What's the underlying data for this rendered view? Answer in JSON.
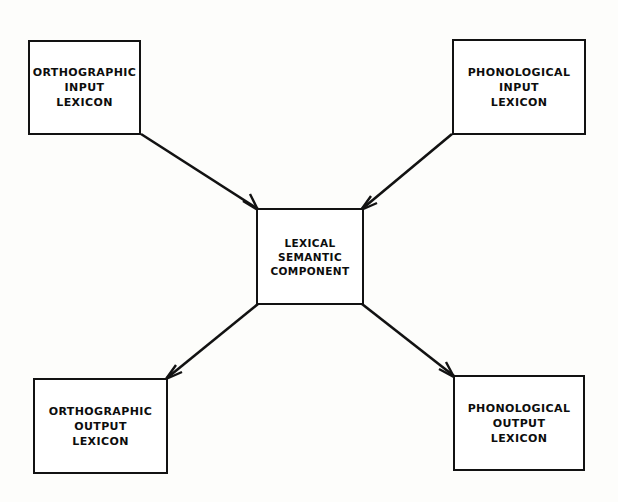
{
  "diagram": {
    "background_color": "#fdfdfb",
    "stroke_color": "#121212",
    "nodes": [
      {
        "id": "ortho-input",
        "lines": [
          "ORTHOGRAPHIC",
          "INPUT",
          "LEXICON"
        ],
        "position": "top-left"
      },
      {
        "id": "phono-input",
        "lines": [
          "PHONOLOGICAL",
          "INPUT",
          "LEXICON"
        ],
        "position": "top-right"
      },
      {
        "id": "lexical-semantic",
        "lines": [
          "LEXICAL",
          "SEMANTIC",
          "COMPONENT"
        ],
        "position": "center"
      },
      {
        "id": "ortho-output",
        "lines": [
          "ORTHOGRAPHIC",
          "OUTPUT",
          "LEXICON"
        ],
        "position": "bottom-left"
      },
      {
        "id": "phono-output",
        "lines": [
          "PHONOLOGICAL",
          "OUTPUT",
          "LEXICON"
        ],
        "position": "bottom-right"
      }
    ],
    "edges": [
      {
        "id": "edge-ortho-input-to-center",
        "from": "ortho-input",
        "to": "lexical-semantic",
        "arrow": "to",
        "x1": 141,
        "y1": 134,
        "x2": 258,
        "y2": 209
      },
      {
        "id": "edge-phono-input-to-center",
        "from": "phono-input",
        "to": "lexical-semantic",
        "arrow": "to",
        "x1": 452,
        "y1": 134,
        "x2": 362,
        "y2": 209
      },
      {
        "id": "edge-center-to-ortho-output",
        "from": "lexical-semantic",
        "to": "ortho-output",
        "arrow": "to",
        "x1": 258,
        "y1": 304,
        "x2": 167,
        "y2": 378
      },
      {
        "id": "edge-center-to-phono-output",
        "from": "lexical-semantic",
        "to": "phono-output",
        "arrow": "to",
        "x1": 362,
        "y1": 304,
        "x2": 454,
        "y2": 376
      }
    ]
  }
}
